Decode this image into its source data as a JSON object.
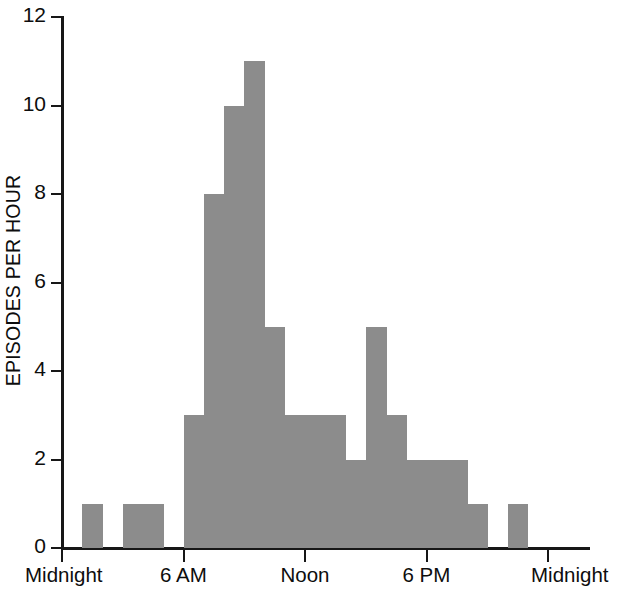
{
  "chart_data": {
    "type": "bar",
    "title": "",
    "xlabel": "",
    "ylabel": "EPISODES PER HOUR",
    "ylim": [
      0,
      12
    ],
    "xlim": [
      0,
      24
    ],
    "grid": false,
    "legend": null,
    "bar_color": "#8c8c8c",
    "axis_color": "#171717",
    "y_ticks": [
      0,
      2,
      4,
      6,
      8,
      10,
      12
    ],
    "y_tick_labels": [
      "0",
      "2",
      "4",
      "6",
      "8",
      "10",
      "12"
    ],
    "x_ticks": [
      0,
      6,
      12,
      18,
      24
    ],
    "x_tick_labels": [
      "Midnight",
      "6 AM",
      "Noon",
      "6 PM",
      "Midnight"
    ],
    "categories": [
      "0-1",
      "1-2",
      "2-3",
      "3-4",
      "4-5",
      "5-6",
      "6-7",
      "7-8",
      "8-9",
      "9-10",
      "10-11",
      "11-12",
      "12-13",
      "13-14",
      "14-15",
      "15-16",
      "16-17",
      "17-18",
      "18-19",
      "19-20",
      "20-21",
      "21-22",
      "22-23",
      "23-24"
    ],
    "values": [
      0,
      1,
      0,
      1,
      1,
      0,
      3,
      8,
      10,
      11,
      5,
      3,
      3,
      3,
      2,
      5,
      3,
      2,
      2,
      2,
      1,
      0,
      1,
      0
    ]
  }
}
